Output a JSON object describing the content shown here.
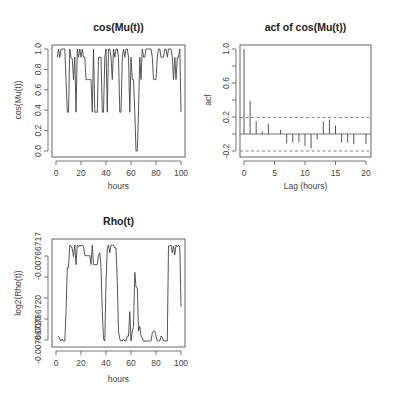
{
  "chart_data": [
    {
      "id": "cosmu",
      "type": "line",
      "title": "cos(Mu(t))",
      "xlabel": "hours",
      "ylabel": "cos(Mu(t))",
      "xlim": [
        0,
        100
      ],
      "ylim": [
        0,
        1
      ],
      "xticks": [
        0,
        20,
        40,
        60,
        80,
        100
      ],
      "yticks": [
        0.0,
        0.2,
        0.4,
        0.6,
        0.8,
        1.0
      ],
      "ytick_labels": [
        "0.0",
        "0.2",
        "0.4",
        "0.6",
        "0.8",
        "1.0"
      ],
      "grid": false,
      "frame": {
        "left": 52,
        "right": 185,
        "top": 45,
        "bottom": 157
      },
      "px": {
        "x0": 56,
        "x1": 181,
        "y0": 151,
        "y1": 49
      },
      "x": [
        1,
        2,
        3,
        4,
        5,
        6,
        7,
        8,
        9,
        10,
        11,
        12,
        13,
        14,
        15,
        16,
        17,
        18,
        19,
        20,
        21,
        22,
        23,
        24,
        25,
        26,
        27,
        28,
        29,
        30,
        31,
        32,
        33,
        34,
        35,
        36,
        37,
        38,
        39,
        40,
        41,
        42,
        43,
        44,
        45,
        46,
        47,
        48,
        49,
        50,
        51,
        52,
        53,
        54,
        55,
        56,
        57,
        58,
        59,
        60,
        61,
        62,
        63,
        64,
        65,
        66,
        67,
        68,
        69,
        70,
        71,
        72,
        73,
        74,
        75,
        76,
        77,
        78,
        79,
        80,
        81,
        82,
        83,
        84,
        85,
        86,
        87,
        88,
        89,
        90,
        91,
        92,
        93,
        94,
        95,
        96,
        97,
        98,
        99,
        100
      ],
      "values": [
        0.92,
        1.0,
        0.92,
        1.0,
        1.0,
        1.0,
        1.0,
        0.7,
        0.38,
        0.38,
        1.0,
        0.92,
        0.9,
        0.7,
        0.92,
        0.38,
        1.0,
        0.92,
        1.0,
        0.92,
        1.0,
        0.92,
        0.92,
        0.7,
        0.7,
        0.7,
        0.7,
        0.7,
        0.38,
        1.0,
        0.38,
        0.38,
        0.38,
        0.92,
        0.92,
        0.92,
        0.38,
        0.38,
        0.92,
        1.0,
        0.38,
        1.0,
        1.0,
        0.92,
        0.7,
        1.0,
        0.92,
        1.0,
        1.0,
        0.92,
        0.38,
        0.38,
        0.92,
        1.0,
        0.92,
        1.0,
        1.0,
        0.92,
        0.38,
        0.92,
        0.7,
        0.7,
        0.38,
        0.0,
        0.0,
        0.38,
        0.92,
        0.7,
        1.0,
        0.92,
        0.92,
        1.0,
        1.0,
        1.0,
        1.0,
        1.0,
        0.92,
        0.7,
        0.7,
        0.7,
        0.92,
        1.0,
        1.0,
        0.92,
        0.92,
        0.92,
        1.0,
        1.0,
        0.92,
        1.0,
        1.0,
        1.0,
        0.92,
        0.7,
        0.92,
        0.7,
        0.92,
        0.92,
        1.0,
        0.38
      ]
    },
    {
      "id": "acf",
      "type": "bar",
      "title": "acf of cos(Mu(t))",
      "xlabel": "Lag (hours)",
      "ylabel": "acf",
      "xlim": [
        0,
        20
      ],
      "ylim": [
        -0.2,
        1.0
      ],
      "xticks": [
        0,
        5,
        10,
        15,
        20
      ],
      "yticks": [
        -0.2,
        0.2,
        0.6,
        1.0
      ],
      "ytick_labels": [
        "-0.2",
        "0.2",
        "0.6",
        "1.0"
      ],
      "minor_yticks": [
        0.0,
        0.4,
        0.8
      ],
      "grid": false,
      "frame": {
        "left": 240,
        "right": 371,
        "top": 45,
        "bottom": 157
      },
      "px": {
        "x0": 244,
        "x1": 366,
        "y0": 134,
        "y1": 49
      },
      "categories": [
        0,
        1,
        2,
        3,
        4,
        5,
        6,
        7,
        8,
        9,
        10,
        11,
        12,
        13,
        14,
        15,
        16,
        17,
        18,
        19,
        20
      ],
      "values": [
        1.0,
        0.39,
        0.15,
        0.03,
        0.12,
        0.0,
        0.05,
        -0.11,
        -0.1,
        -0.1,
        -0.14,
        -0.17,
        -0.06,
        0.15,
        0.17,
        0.1,
        -0.1,
        -0.1,
        -0.12,
        0.0,
        -0.12
      ],
      "confidence_bounds": [
        0.195,
        -0.2
      ],
      "zero_line": true
    },
    {
      "id": "rho",
      "type": "line",
      "title": "Rho(t)",
      "xlabel": "hours",
      "ylabel": "log2(Rho(t))",
      "xlim": [
        0,
        100
      ],
      "xticks": [
        0,
        20,
        40,
        60,
        80,
        100
      ],
      "ytick_px": [
        256,
        277,
        298,
        319,
        340
      ],
      "ytick_labels": [
        "-0.00766717",
        "",
        "",
        "-0.00766720",
        "-0.00766720"
      ],
      "grid": false,
      "frame": {
        "left": 52,
        "right": 185,
        "top": 239,
        "bottom": 347
      },
      "px": {
        "x0": 56,
        "x1": 181,
        "y0": 341,
        "y1": 243
      },
      "note": "values normalized 0 (bottom, ~-0.0076672) to 1 (top, ~-0.00766716)",
      "x": [
        2,
        3,
        4,
        5,
        6,
        7,
        8,
        9,
        10,
        11,
        12,
        13,
        14,
        15,
        16,
        17,
        18,
        19,
        20,
        21,
        22,
        23,
        24,
        25,
        26,
        27,
        28,
        29,
        30,
        31,
        32,
        33,
        34,
        35,
        36,
        37,
        38,
        39,
        40,
        41,
        42,
        43,
        44,
        45,
        46,
        47,
        48,
        49,
        50,
        51,
        52,
        53,
        54,
        55,
        56,
        57,
        58,
        59,
        60,
        61,
        62,
        63,
        64,
        65,
        66,
        67,
        68,
        69,
        70,
        71,
        72,
        73,
        74,
        75,
        76,
        77,
        78,
        79,
        80,
        81,
        82,
        83,
        84,
        85,
        86,
        87,
        88,
        89,
        90,
        91,
        92,
        93,
        94,
        95,
        96,
        97,
        98,
        99,
        100
      ],
      "values": [
        0.05,
        0.02,
        0.0,
        0.02,
        0.0,
        0.0,
        0.3,
        0.75,
        0.75,
        0.98,
        0.97,
        0.94,
        0.86,
        0.98,
        0.78,
        0.98,
        0.96,
        0.98,
        0.97,
        0.98,
        0.96,
        0.87,
        0.87,
        0.87,
        0.87,
        0.87,
        0.78,
        0.98,
        0.78,
        0.78,
        0.78,
        0.78,
        0.88,
        0.9,
        0.75,
        0.3,
        0.02,
        0.0,
        0.6,
        0.95,
        0.98,
        0.9,
        0.98,
        0.98,
        0.98,
        0.95,
        0.95,
        0.6,
        0.1,
        0.02,
        0.0,
        0.0,
        0.02,
        0.0,
        0.0,
        0.05,
        0.05,
        0.3,
        0.0,
        0.1,
        0.15,
        0.7,
        0.55,
        0.54,
        0.1,
        0.15,
        0.05,
        0.03,
        0.0,
        0.0,
        0.0,
        0.0,
        0.0,
        0.0,
        0.0,
        0.08,
        0.1,
        0.1,
        0.05,
        0.0,
        0.0,
        0.0,
        0.05,
        0.04,
        0.0,
        0.0,
        0.0,
        0.0,
        0.97,
        0.97,
        0.98,
        0.9,
        0.97,
        0.88,
        0.98,
        0.96,
        0.98,
        0.96,
        0.35
      ]
    }
  ]
}
